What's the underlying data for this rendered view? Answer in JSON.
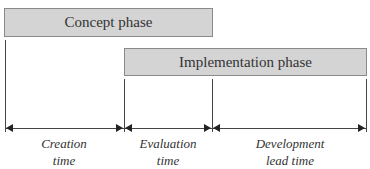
{
  "phases": [
    {
      "label": "Concept phase"
    },
    {
      "label": "Implementation phase"
    }
  ],
  "intervals": [
    {
      "line1": "Creation",
      "line2": "time"
    },
    {
      "line1": "Evaluation",
      "line2": "time"
    },
    {
      "line1": "Development",
      "line2": "lead time"
    }
  ],
  "colors": {
    "bar_fill": "#d4d4d4",
    "bar_border": "#8a8a8a",
    "line": "#444444"
  }
}
